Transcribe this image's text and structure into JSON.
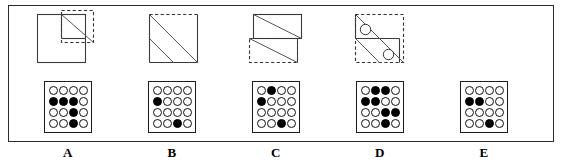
{
  "figure": {
    "kind": "multiple-choice-answer-plate",
    "option_count": 5,
    "grid_rows": 4,
    "grid_cols": 4,
    "colors": {
      "ink": "#000000",
      "border": "#2b2b2b",
      "paper": "#ffffff",
      "dashed": "#333333"
    }
  },
  "options": [
    {
      "letter": "A",
      "shape_name": "square-with-notched-corner-and-diagonal",
      "shape_description": "Large solid-outlined square; a dashed square overlaps its top-right corner; a diagonal line runs across the small upper-right sub-square from its top-left to its bottom-right.",
      "dots": [
        [
          0,
          0,
          0,
          0
        ],
        [
          1,
          1,
          1,
          0
        ],
        [
          0,
          0,
          1,
          0
        ],
        [
          0,
          0,
          1,
          0
        ]
      ]
    },
    {
      "letter": "B",
      "shape_name": "square-with-two-parallel-diagonals",
      "shape_description": "Square with a dashed top edge and solid left, bottom and right edges; two parallel diagonal lines run from upper-left toward lower-right.",
      "dots": [
        [
          0,
          0,
          0,
          0
        ],
        [
          1,
          0,
          0,
          0
        ],
        [
          0,
          0,
          0,
          0
        ],
        [
          0,
          0,
          1,
          0
        ]
      ]
    },
    {
      "letter": "C",
      "shape_name": "half-square-stacked-with-dashed-half",
      "shape_description": "Square split by a horizontal mid-line; the upper half is solid-outlined with a diagonal, the lower half is dashed-outlined with a diagonal.",
      "dots": [
        [
          0,
          1,
          0,
          0
        ],
        [
          1,
          0,
          0,
          0
        ],
        [
          0,
          0,
          0,
          0
        ],
        [
          0,
          0,
          1,
          0
        ]
      ]
    },
    {
      "letter": "D",
      "shape_name": "dashed-square-with-diagonal-and-two-circles",
      "shape_description": "Dashed square with a horizontal mid-line and long diagonal from top-left to bottom-right; two small open circles sit on the diagonal, one in the upper half and one in the lower half.",
      "dots": [
        [
          0,
          1,
          1,
          0
        ],
        [
          1,
          1,
          0,
          0
        ],
        [
          0,
          0,
          1,
          1
        ],
        [
          0,
          0,
          1,
          0
        ]
      ]
    },
    {
      "letter": "E",
      "shape_name": "blank-cell",
      "shape_description": "No figure drawn above this option.",
      "dots": [
        [
          0,
          0,
          0,
          0
        ],
        [
          1,
          1,
          0,
          0
        ],
        [
          0,
          0,
          0,
          0
        ],
        [
          0,
          0,
          1,
          0
        ]
      ]
    }
  ]
}
